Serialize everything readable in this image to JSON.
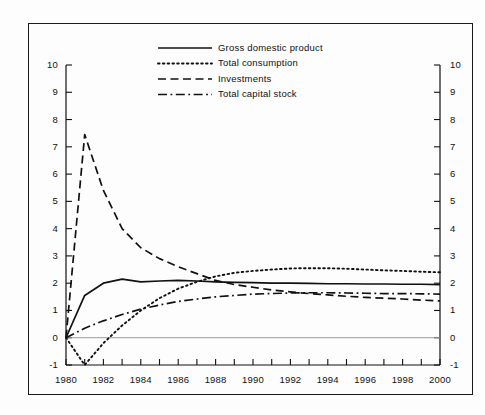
{
  "chart_data": {
    "type": "line",
    "title": "",
    "subtitle": "",
    "xlabel": "",
    "ylabel": "",
    "xlim": [
      1980,
      2000
    ],
    "ylim": [
      -1,
      10
    ],
    "grid": false,
    "zero_line": true,
    "legend_position": "top-center",
    "x_tick_step": 1,
    "x_label_step": 2,
    "y_tick_step": 1,
    "dual_y_axis": true,
    "x_tick_labels": [
      "1980",
      "1982",
      "1984",
      "1986",
      "1988",
      "1990",
      "1992",
      "1994",
      "1996",
      "1998",
      "2000"
    ],
    "y_tick_labels": [
      "10",
      "9",
      "8",
      "7",
      "6",
      "5",
      "4",
      "3",
      "2",
      "1",
      "0",
      "-1"
    ],
    "x": [
      1980,
      1981,
      1982,
      1983,
      1984,
      1985,
      1986,
      1987,
      1988,
      1989,
      1990,
      1991,
      1992,
      1993,
      1994,
      1995,
      1996,
      1997,
      1998,
      1999,
      2000
    ],
    "series": [
      {
        "name": "Gross domestic product",
        "style": "solid",
        "color": "#111111",
        "values": [
          0.0,
          1.55,
          2.0,
          2.15,
          2.05,
          2.08,
          2.1,
          2.08,
          2.05,
          2.03,
          2.02,
          2.0,
          2.0,
          1.99,
          1.98,
          1.98,
          1.97,
          1.97,
          1.96,
          1.96,
          1.95
        ]
      },
      {
        "name": "Total consumption",
        "style": "dotted",
        "color": "#111111",
        "values": [
          0.0,
          -1.0,
          -0.2,
          0.45,
          1.0,
          1.45,
          1.8,
          2.05,
          2.25,
          2.38,
          2.45,
          2.5,
          2.54,
          2.55,
          2.55,
          2.53,
          2.5,
          2.47,
          2.45,
          2.42,
          2.4
        ]
      },
      {
        "name": "Investments",
        "style": "dashed",
        "color": "#111111",
        "values": [
          0.0,
          7.45,
          5.4,
          4.0,
          3.3,
          2.9,
          2.6,
          2.35,
          2.1,
          1.95,
          1.85,
          1.75,
          1.68,
          1.62,
          1.57,
          1.52,
          1.48,
          1.45,
          1.42,
          1.38,
          1.35
        ]
      },
      {
        "name": "Total capital stock",
        "style": "dashdot",
        "color": "#111111",
        "values": [
          0.0,
          0.35,
          0.62,
          0.85,
          1.05,
          1.2,
          1.33,
          1.42,
          1.5,
          1.55,
          1.6,
          1.62,
          1.64,
          1.65,
          1.65,
          1.64,
          1.63,
          1.62,
          1.62,
          1.61,
          1.6
        ]
      }
    ]
  },
  "legend": {
    "items": [
      {
        "label": "Gross domestic product",
        "style": "solid"
      },
      {
        "label": "Total consumption",
        "style": "dotted"
      },
      {
        "label": "Investments",
        "style": "dashed"
      },
      {
        "label": "Total capital stock",
        "style": "dashdot"
      }
    ]
  }
}
